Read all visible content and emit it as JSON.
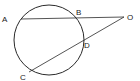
{
  "diagram": {
    "type": "circle-two-secants",
    "stroke_color": "#2a2a2a",
    "circle": {
      "cx": 49,
      "cy": 40,
      "r": 35
    },
    "points": [
      {
        "id": "A",
        "label": "A",
        "x": 21,
        "y": 19,
        "lx": 2,
        "ly": 22
      },
      {
        "id": "B",
        "label": "B",
        "x": 77,
        "y": 18,
        "lx": 76,
        "ly": 15
      },
      {
        "id": "O",
        "label": "O",
        "x": 124,
        "y": 17,
        "lx": 127,
        "ly": 20
      },
      {
        "id": "D",
        "label": "D",
        "x": 82,
        "y": 40,
        "lx": 84,
        "ly": 48
      },
      {
        "id": "C",
        "label": "C",
        "x": 29,
        "y": 72,
        "lx": 20,
        "ly": 80
      }
    ],
    "segments": [
      {
        "from": "A",
        "to": "O"
      },
      {
        "from": "C",
        "to": "O"
      }
    ]
  }
}
